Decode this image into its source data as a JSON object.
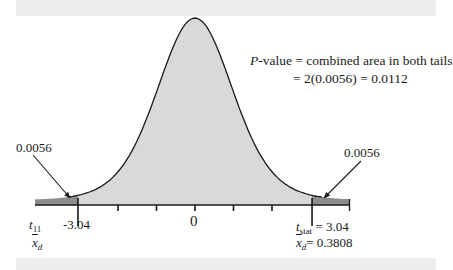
{
  "figure": {
    "annotation": {
      "line1_prefix": "P",
      "line1_rest": "-value = combined area in both tails",
      "line2": "= 2(0.0056) = 0.0112"
    },
    "left_tail_label": "0.0056",
    "right_tail_label": "0.0056",
    "center_tick_label": "0",
    "left_crit_label": "-3.04",
    "left_axis_names": {
      "t_symbol": "t",
      "t_sub": "11",
      "xbar_symbol": "x",
      "xbar_sub": "d"
    },
    "right_stat": {
      "t_symbol": "t",
      "t_sub": "stat",
      "t_value": " = 3.04",
      "xbar_symbol": "x",
      "xbar_sub": "d",
      "xbar_value": "= 0.3808"
    },
    "colors": {
      "body_fill": "#d9d9d9",
      "tail_fill": "#8c8c8c",
      "stroke": "#1a1a1a",
      "band": "#ececec"
    }
  },
  "chart_data": {
    "type": "area",
    "title": "",
    "distribution": "t",
    "df": 11,
    "x_ticks": [
      -3.04,
      -2,
      -1,
      0,
      1,
      2,
      3.04
    ],
    "tick_labels_shown": {
      "-3.04": "-3.04",
      "0": "0",
      "3.04": "t_stat = 3.04"
    },
    "t_stat": 3.04,
    "xbar_d": 0.3808,
    "tail_areas": {
      "left": 0.0056,
      "right": 0.0056
    },
    "p_value": 0.0112,
    "shaded_regions": [
      "t <= -3.04",
      "t >= 3.04"
    ]
  }
}
